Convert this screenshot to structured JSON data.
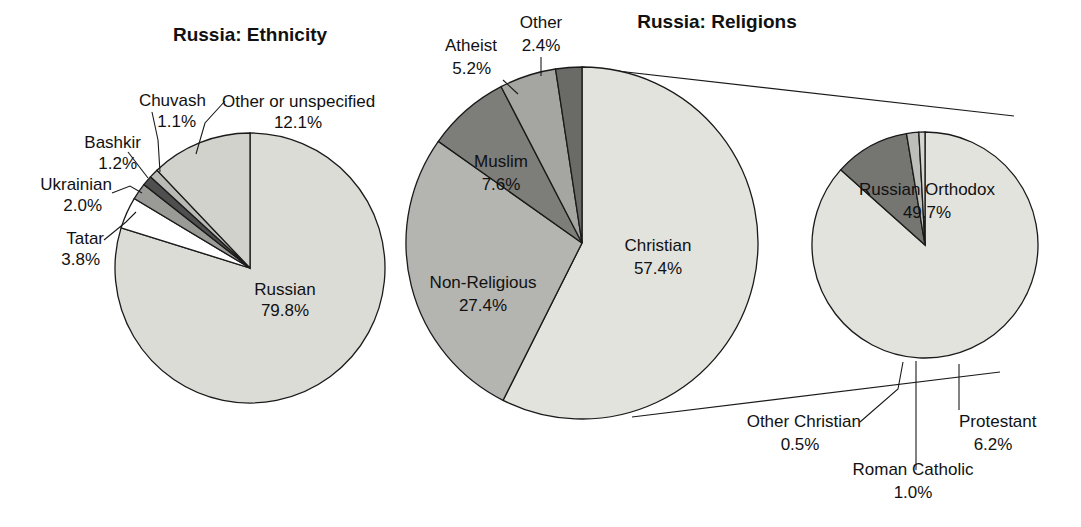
{
  "figure": {
    "background": "#ffffff",
    "outline_color": "#1a1a1a"
  },
  "charts": {
    "ethnicity": {
      "title": "Russia: Ethnicity",
      "labels": {
        "russian_name": "Russian",
        "russian_value": "79.8%",
        "tatar_name": "Tatar",
        "tatar_value": "3.8%",
        "ukrainian_name": "Ukrainian",
        "ukrainian_value": "2.0%",
        "bashkir_name": "Bashkir",
        "bashkir_value": "1.2%",
        "chuvash_name": "Chuvash",
        "chuvash_value": "1.1%",
        "other_name": "Other or unspecified",
        "other_value": "12.1%"
      }
    },
    "religions": {
      "title": "Russia: Religions",
      "labels": {
        "christian_name": "Christian",
        "christian_value": "57.4%",
        "nonreligious_name": "Non-Religious",
        "nonreligious_value": "27.4%",
        "muslim_name": "Muslim",
        "muslim_value": "7.6%",
        "atheist_name": "Atheist",
        "atheist_value": "5.2%",
        "other_name": "Other",
        "other_value": "2.4%"
      }
    },
    "christian_breakdown": {
      "labels": {
        "orthodox_name": "Russian Orthodox",
        "orthodox_value": "49.7%",
        "protestant_name": "Protestant",
        "protestant_value": "6.2%",
        "catholic_name": "Roman Catholic",
        "catholic_value": "1.0%",
        "other_name": "Other Christian",
        "other_value": "0.5%"
      }
    }
  },
  "chart_data": [
    {
      "type": "pie",
      "title": "Russia: Ethnicity",
      "unit": "percent",
      "start_angle_deg": 0,
      "direction": "clockwise",
      "center": [
        250,
        268
      ],
      "radius": 135,
      "categories": [
        "Russian",
        "Tatar",
        "Ukrainian",
        "Bashkir",
        "Chuvash",
        "Other or unspecified"
      ],
      "values": [
        79.8,
        3.8,
        2.0,
        1.2,
        1.1,
        12.1
      ],
      "colors": [
        "#dcdcd7",
        "#ffffff",
        "#9a9a97",
        "#4f4f4f",
        "#b9b9b5",
        "#d2d2cd"
      ],
      "labels_outside": [
        "Tatar",
        "Ukrainian",
        "Bashkir",
        "Chuvash",
        "Other or unspecified"
      ],
      "labels_inside": [
        "Russian"
      ]
    },
    {
      "type": "pie",
      "title": "Russia: Religions",
      "unit": "percent",
      "start_angle_deg": 0,
      "direction": "clockwise",
      "center": [
        582,
        243
      ],
      "radius": 176,
      "categories": [
        "Christian",
        "Non-Religious",
        "Muslim",
        "Atheist",
        "Other"
      ],
      "values": [
        57.4,
        27.4,
        7.6,
        5.2,
        2.4
      ],
      "colors": [
        "#e3e3de",
        "#b4b4b0",
        "#7d7d7a",
        "#a5a5a1",
        "#6a6a67"
      ],
      "labels_inside": [
        "Christian",
        "Non-Religious",
        "Muslim"
      ],
      "labels_outside": [
        "Atheist",
        "Other"
      ]
    },
    {
      "type": "pie",
      "title": "",
      "subtitle": "Breakdown of the Christian share",
      "unit": "percent_of_total_population",
      "start_angle_deg": 0,
      "direction": "clockwise",
      "center": [
        925,
        245
      ],
      "radius": 113,
      "categories": [
        "Russian Orthodox",
        "Protestant",
        "Roman Catholic",
        "Other Christian"
      ],
      "values": [
        49.7,
        6.2,
        1.0,
        0.5
      ],
      "colors": [
        "#e3e3de",
        "#757572",
        "#bdbdb9",
        "#d6d6d1"
      ],
      "labels_inside": [
        "Russian Orthodox"
      ],
      "labels_outside": [
        "Protestant",
        "Roman Catholic",
        "Other Christian"
      ],
      "exploded_from": "Christian"
    }
  ]
}
